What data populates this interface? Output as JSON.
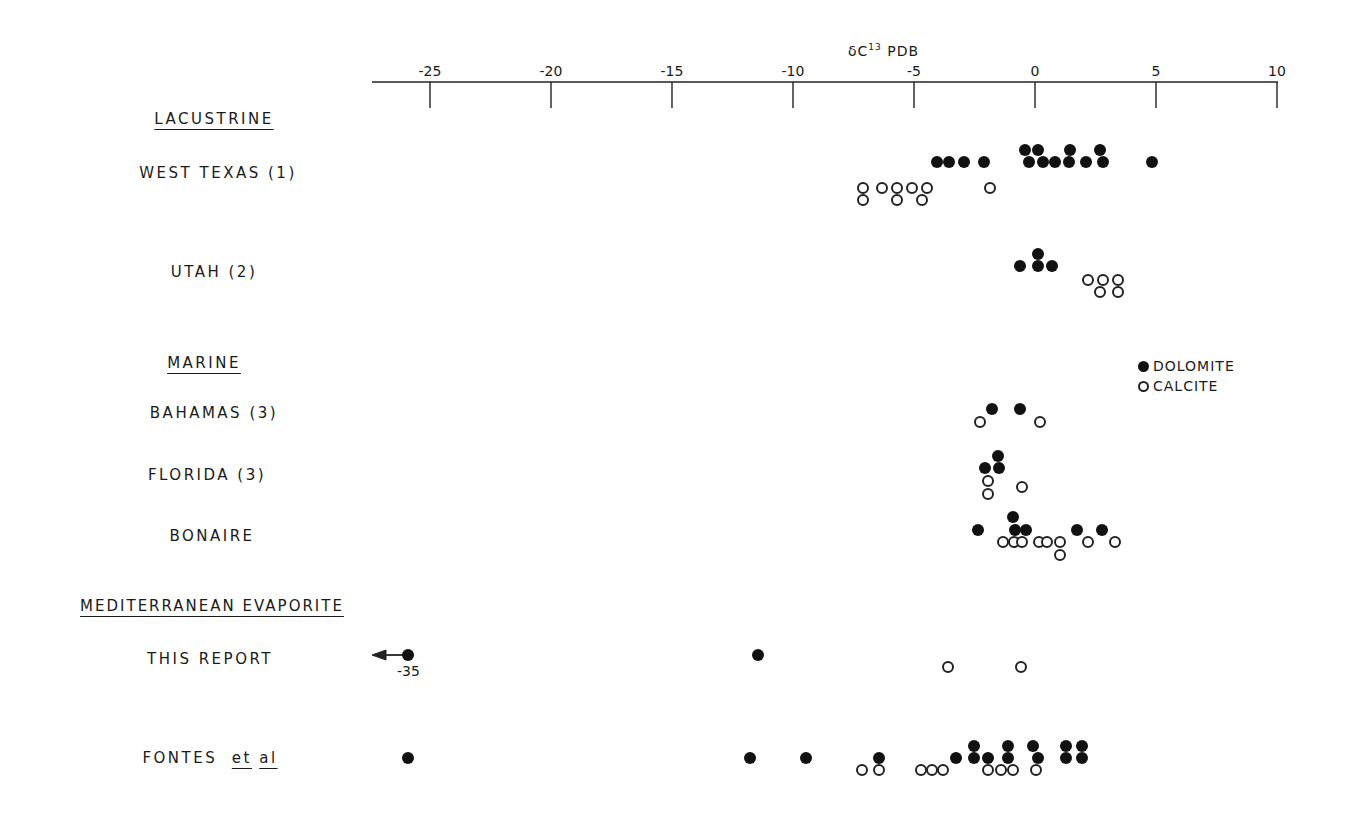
{
  "chart_data": {
    "type": "scatter",
    "title": "",
    "xlabel": "δC13 PDB",
    "xlabel_main": "δC",
    "xlabel_sup": "13",
    "xlabel_suffix": " PDB",
    "xlim": [
      -27.5,
      10
    ],
    "x_ticks": [
      -25,
      -20,
      -15,
      -10,
      -5,
      0,
      5,
      10
    ],
    "x_tick_labels": [
      "-25",
      "-20",
      "-15",
      "-10",
      "-5",
      "0",
      "5",
      "10"
    ],
    "legend": [
      {
        "label": "DOLOMITE",
        "marker": "filled-circle"
      },
      {
        "label": "CALCITE",
        "marker": "open-circle"
      }
    ],
    "groups": [
      {
        "header": "LACUSTRINE",
        "categories": [
          {
            "label": "WEST TEXAS (1)",
            "dolomite": [
              -4.1,
              -3.6,
              -2.9,
              -2.1,
              -0.4,
              0.1,
              1.4,
              2.7,
              -0.2,
              0.3,
              0.8,
              1.4,
              2.1,
              2.8,
              4.8
            ],
            "calcite": [
              -7.1,
              -6.3,
              -5.7,
              -5.1,
              -4.5,
              -1.9,
              -7.1,
              -5.7,
              -4.7
            ]
          },
          {
            "label": "UTAH (2)",
            "dolomite": [
              -0.6,
              0.1,
              0.1,
              0.7
            ],
            "calcite": [
              2.2,
              2.8,
              2.7,
              3.4,
              3.4
            ]
          }
        ]
      },
      {
        "header": "MARINE",
        "categories": [
          {
            "label": "BAHAMAS (3)",
            "dolomite": [
              -1.8,
              -0.6
            ],
            "calcite": [
              -2.3,
              0.2
            ]
          },
          {
            "label": "FLORIDA (3)",
            "dolomite": [
              -1.5,
              -2.1,
              -1.5
            ],
            "calcite": [
              -1.9,
              -1.9,
              -0.5
            ]
          },
          {
            "label": "BONAIRE",
            "dolomite": [
              -2.4,
              -0.9,
              -0.8,
              -0.4,
              1.7,
              2.7
            ],
            "calcite": [
              -1.3,
              -0.9,
              -0.5,
              0.2,
              0.5,
              1.0,
              1.0,
              2.2,
              3.3
            ]
          }
        ]
      },
      {
        "header": "MEDITERRANEAN EVAPORITE",
        "categories": [
          {
            "label": "THIS REPORT",
            "dolomite": [
              -35,
              -11.3
            ],
            "calcite": [
              -3.6,
              -0.6
            ],
            "annotation": "-35 (off-scale, arrow left)"
          },
          {
            "label": "FONTES et al",
            "dolomite": [
              -25.9,
              -11.8,
              -9.5,
              -6.5,
              -3.3,
              -2.5,
              -2.5,
              -1.9,
              -1.1,
              -1.1,
              0.1,
              -0.1,
              1.3,
              1.3,
              1.9,
              1.9
            ],
            "calcite": [
              -7.0,
              -6.5,
              -4.7,
              -4.2,
              -3.8,
              -1.9,
              -1.4,
              -0.9,
              0.0
            ]
          }
        ]
      }
    ]
  },
  "labels": {
    "lacustrine": "LACUSTRINE",
    "west_texas": "WEST TEXAS (1)",
    "utah": "UTAH (2)",
    "marine": "MARINE",
    "bahamas": "BAHAMAS (3)",
    "florida": "FLORIDA (3)",
    "bonaire": "BONAIRE",
    "med": "MEDITERRANEAN EVAPORITE",
    "this_report": "THIS REPORT",
    "fontes": "FONTES",
    "et": "et",
    "al": "al",
    "offscale": "-35"
  },
  "legend": {
    "dolomite": "DOLOMITE",
    "calcite": "CALCITE"
  },
  "points": [
    {
      "x": 937,
      "y": 162,
      "t": "filled"
    },
    {
      "x": 949,
      "y": 162,
      "t": "filled"
    },
    {
      "x": 964,
      "y": 162,
      "t": "filled"
    },
    {
      "x": 984,
      "y": 162,
      "t": "filled"
    },
    {
      "x": 1025,
      "y": 150,
      "t": "filled"
    },
    {
      "x": 1038,
      "y": 150,
      "t": "filled"
    },
    {
      "x": 1070,
      "y": 150,
      "t": "filled"
    },
    {
      "x": 1100,
      "y": 150,
      "t": "filled"
    },
    {
      "x": 1029,
      "y": 162,
      "t": "filled"
    },
    {
      "x": 1043,
      "y": 162,
      "t": "filled"
    },
    {
      "x": 1055,
      "y": 162,
      "t": "filled"
    },
    {
      "x": 1069,
      "y": 162,
      "t": "filled"
    },
    {
      "x": 1086,
      "y": 162,
      "t": "filled"
    },
    {
      "x": 1103,
      "y": 162,
      "t": "filled"
    },
    {
      "x": 1152,
      "y": 162,
      "t": "filled"
    },
    {
      "x": 863,
      "y": 188,
      "t": "open"
    },
    {
      "x": 882,
      "y": 188,
      "t": "open"
    },
    {
      "x": 897,
      "y": 188,
      "t": "open"
    },
    {
      "x": 912,
      "y": 188,
      "t": "open"
    },
    {
      "x": 927,
      "y": 188,
      "t": "open"
    },
    {
      "x": 990,
      "y": 188,
      "t": "open"
    },
    {
      "x": 863,
      "y": 200,
      "t": "open"
    },
    {
      "x": 897,
      "y": 200,
      "t": "open"
    },
    {
      "x": 922,
      "y": 200,
      "t": "open"
    },
    {
      "x": 1020,
      "y": 266,
      "t": "filled"
    },
    {
      "x": 1038,
      "y": 254,
      "t": "filled"
    },
    {
      "x": 1038,
      "y": 266,
      "t": "filled"
    },
    {
      "x": 1052,
      "y": 266,
      "t": "filled"
    },
    {
      "x": 1088,
      "y": 280,
      "t": "open"
    },
    {
      "x": 1103,
      "y": 280,
      "t": "open"
    },
    {
      "x": 1100,
      "y": 292,
      "t": "open"
    },
    {
      "x": 1118,
      "y": 280,
      "t": "open"
    },
    {
      "x": 1118,
      "y": 292,
      "t": "open"
    },
    {
      "x": 992,
      "y": 409,
      "t": "filled"
    },
    {
      "x": 1020,
      "y": 409,
      "t": "filled"
    },
    {
      "x": 980,
      "y": 422,
      "t": "open"
    },
    {
      "x": 1040,
      "y": 422,
      "t": "open"
    },
    {
      "x": 998,
      "y": 456,
      "t": "filled"
    },
    {
      "x": 985,
      "y": 468,
      "t": "filled"
    },
    {
      "x": 999,
      "y": 468,
      "t": "filled"
    },
    {
      "x": 988,
      "y": 481,
      "t": "open"
    },
    {
      "x": 988,
      "y": 494,
      "t": "open"
    },
    {
      "x": 1022,
      "y": 487,
      "t": "open"
    },
    {
      "x": 978,
      "y": 530,
      "t": "filled"
    },
    {
      "x": 1013,
      "y": 517,
      "t": "filled"
    },
    {
      "x": 1015,
      "y": 530,
      "t": "filled"
    },
    {
      "x": 1026,
      "y": 530,
      "t": "filled"
    },
    {
      "x": 1077,
      "y": 530,
      "t": "filled"
    },
    {
      "x": 1102,
      "y": 530,
      "t": "filled"
    },
    {
      "x": 1003,
      "y": 542,
      "t": "open"
    },
    {
      "x": 1014,
      "y": 542,
      "t": "open"
    },
    {
      "x": 1022,
      "y": 542,
      "t": "open"
    },
    {
      "x": 1039,
      "y": 542,
      "t": "open"
    },
    {
      "x": 1047,
      "y": 542,
      "t": "open"
    },
    {
      "x": 1060,
      "y": 542,
      "t": "open"
    },
    {
      "x": 1088,
      "y": 542,
      "t": "open"
    },
    {
      "x": 1115,
      "y": 542,
      "t": "open"
    },
    {
      "x": 1060,
      "y": 555,
      "t": "open"
    },
    {
      "x": 408,
      "y": 655,
      "t": "filled"
    },
    {
      "x": 758,
      "y": 655,
      "t": "filled"
    },
    {
      "x": 948,
      "y": 667,
      "t": "open"
    },
    {
      "x": 1021,
      "y": 667,
      "t": "open"
    },
    {
      "x": 408,
      "y": 758,
      "t": "filled"
    },
    {
      "x": 750,
      "y": 758,
      "t": "filled"
    },
    {
      "x": 806,
      "y": 758,
      "t": "filled"
    },
    {
      "x": 879,
      "y": 758,
      "t": "filled"
    },
    {
      "x": 956,
      "y": 758,
      "t": "filled"
    },
    {
      "x": 974,
      "y": 758,
      "t": "filled"
    },
    {
      "x": 988,
      "y": 758,
      "t": "filled"
    },
    {
      "x": 1008,
      "y": 758,
      "t": "filled"
    },
    {
      "x": 1038,
      "y": 758,
      "t": "filled"
    },
    {
      "x": 1066,
      "y": 758,
      "t": "filled"
    },
    {
      "x": 1082,
      "y": 758,
      "t": "filled"
    },
    {
      "x": 974,
      "y": 746,
      "t": "filled"
    },
    {
      "x": 1008,
      "y": 746,
      "t": "filled"
    },
    {
      "x": 1033,
      "y": 746,
      "t": "filled"
    },
    {
      "x": 1066,
      "y": 746,
      "t": "filled"
    },
    {
      "x": 1082,
      "y": 746,
      "t": "filled"
    },
    {
      "x": 862,
      "y": 770,
      "t": "open"
    },
    {
      "x": 879,
      "y": 770,
      "t": "open"
    },
    {
      "x": 921,
      "y": 770,
      "t": "open"
    },
    {
      "x": 932,
      "y": 770,
      "t": "open"
    },
    {
      "x": 943,
      "y": 770,
      "t": "open"
    },
    {
      "x": 988,
      "y": 770,
      "t": "open"
    },
    {
      "x": 1001,
      "y": 770,
      "t": "open"
    },
    {
      "x": 1013,
      "y": 770,
      "t": "open"
    },
    {
      "x": 1036,
      "y": 770,
      "t": "open"
    }
  ]
}
